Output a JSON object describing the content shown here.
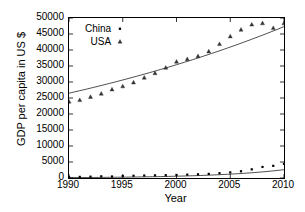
{
  "chart_data": {
    "type": "scatter",
    "title": "",
    "xlabel": "Year",
    "ylabel": "GDP per capita in US $",
    "xlim": [
      1990,
      2010
    ],
    "ylim": [
      0,
      50000
    ],
    "grid": false,
    "legend_position": "top-left",
    "xticks": [
      1990,
      1995,
      2000,
      2005,
      2010
    ],
    "xtick_labels": [
      "1990",
      "1995",
      "2000",
      "2005",
      "2010"
    ],
    "yticks": [
      0,
      5000,
      10000,
      15000,
      20000,
      25000,
      30000,
      35000,
      40000,
      45000,
      50000
    ],
    "ytick_labels": [
      "0",
      "5000",
      "10000",
      "15000",
      "20000",
      "25000",
      "30000",
      "35000",
      "40000",
      "45000",
      "50000"
    ],
    "x": [
      1990,
      1991,
      1992,
      1993,
      1994,
      1995,
      1996,
      1997,
      1998,
      1999,
      2000,
      2001,
      2002,
      2003,
      2004,
      2005,
      2006,
      2007,
      2008,
      2009,
      2010
    ],
    "series": [
      {
        "name": "China",
        "marker": "dot",
        "values": [
          320,
          350,
          420,
          520,
          470,
          600,
          700,
          770,
          820,
          870,
          950,
          1050,
          1150,
          1280,
          1500,
          1750,
          2100,
          2700,
          3450,
          3800,
          4430
        ],
        "fit_line": {
          "type": "exponential",
          "start": [
            1990,
            120
          ],
          "end": [
            2010,
            2600
          ]
        }
      },
      {
        "name": "USA",
        "marker": "triangle",
        "values": [
          23900,
          24400,
          25400,
          26400,
          27700,
          28700,
          29900,
          31400,
          32800,
          34500,
          36400,
          37200,
          38100,
          39600,
          41900,
          44300,
          46400,
          48000,
          48400,
          46900,
          48400
        ],
        "fit_line": {
          "type": "exponential",
          "start": [
            1990,
            26500
          ],
          "end": [
            2010,
            47300
          ]
        }
      }
    ]
  },
  "legend": {
    "items": [
      {
        "label": "China",
        "marker": "dot"
      },
      {
        "label": "USA",
        "marker": "triangle"
      }
    ]
  }
}
